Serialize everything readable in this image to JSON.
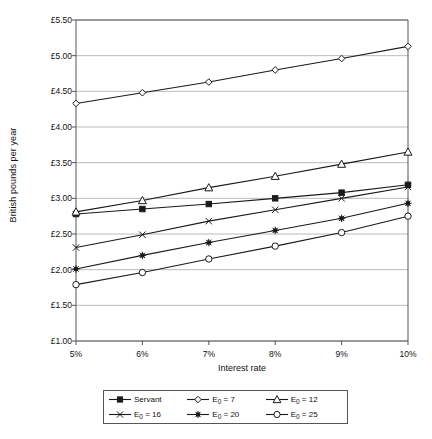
{
  "chart_data": {
    "type": "line",
    "title": "",
    "xlabel": "Interest rate",
    "ylabel": "British pounds per year",
    "categories": [
      "5%",
      "6%",
      "7%",
      "8%",
      "9%",
      "10%"
    ],
    "x": [
      5,
      6,
      7,
      8,
      9,
      10
    ],
    "ylim": [
      1.0,
      5.5
    ],
    "ytick_values": [
      1.0,
      1.5,
      2.0,
      2.5,
      3.0,
      3.5,
      4.0,
      4.5,
      5.0,
      5.5
    ],
    "ytick_labels": [
      "£1.00",
      "£1.50",
      "£2.00",
      "£2.50",
      "£3.00",
      "£3.50",
      "£4.00",
      "£4.50",
      "£5.00",
      "£5.50"
    ],
    "grid": "horizontal",
    "legend_position": "bottom",
    "series": [
      {
        "name": "Servant",
        "marker": "filled-square",
        "values": [
          2.78,
          2.85,
          2.92,
          3.0,
          3.08,
          3.19
        ]
      },
      {
        "name": "E0 = 7",
        "marker": "open-diamond",
        "values": [
          4.33,
          4.48,
          4.63,
          4.8,
          4.96,
          5.13
        ]
      },
      {
        "name": "E0 = 12",
        "marker": "open-triangle",
        "values": [
          2.81,
          2.97,
          3.15,
          3.31,
          3.48,
          3.65
        ]
      },
      {
        "name": "E0 = 16",
        "marker": "cross",
        "values": [
          2.31,
          2.49,
          2.68,
          2.84,
          3.0,
          3.16
        ]
      },
      {
        "name": "E0 = 20",
        "marker": "filled-star",
        "values": [
          2.01,
          2.2,
          2.38,
          2.55,
          2.72,
          2.93
        ]
      },
      {
        "name": "E0 = 25",
        "marker": "open-circle",
        "values": [
          1.79,
          1.96,
          2.15,
          2.33,
          2.52,
          2.75
        ]
      }
    ]
  },
  "legend": {
    "entries": [
      {
        "label_prefix": "Servant",
        "label_sub": "",
        "label_suffix": ""
      },
      {
        "label_prefix": "E",
        "label_sub": "0",
        "label_suffix": " = 7"
      },
      {
        "label_prefix": "E",
        "label_sub": "0",
        "label_suffix": " = 12"
      },
      {
        "label_prefix": "E",
        "label_sub": "0",
        "label_suffix": " = 16"
      },
      {
        "label_prefix": "E",
        "label_sub": "0",
        "label_suffix": " = 20"
      },
      {
        "label_prefix": "E",
        "label_sub": "0",
        "label_suffix": " = 25"
      }
    ]
  },
  "colors": {
    "line": "#1a1a1a",
    "grid": "#a8a8a8",
    "axis": "#555555",
    "background": "#ffffff"
  }
}
